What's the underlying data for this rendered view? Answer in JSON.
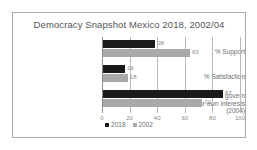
{
  "chart_data": {
    "type": "bar",
    "orientation": "horizontal",
    "title": "Democracy Snapshot Mexico 2018, 2002/04",
    "xlabel": "",
    "ylabel": "",
    "xlim": [
      0,
      100
    ],
    "xticks": [
      "0",
      "20",
      "40",
      "60",
      "80",
      "100"
    ],
    "grid": true,
    "legend_position": "bottom",
    "categories": [
      "% Support",
      "% Satisfaction",
      "% Powerful govern for own interests (2004)"
    ],
    "category_lines": [
      [
        "% Support"
      ],
      [
        "% Satisfaction"
      ],
      [
        "% Powerful govern",
        "for own interests",
        "(2004)"
      ]
    ],
    "series": [
      {
        "name": "2018",
        "color": "#1a1a1a",
        "values": [
          38,
          16,
          87
        ]
      },
      {
        "name": "2002",
        "color": "#a9a9a9",
        "values": [
          63,
          18,
          72
        ]
      }
    ]
  },
  "legend": {
    "items": [
      {
        "label": "2018",
        "color": "#1a1a1a"
      },
      {
        "label": "2002",
        "color": "#a9a9a9"
      }
    ]
  },
  "colors": {
    "series_2018": "#1a1a1a",
    "series_2002": "#a9a9a9",
    "gridline": "#b9b9b9",
    "frame": "#aaaaaa",
    "text": "#6f6f6f"
  }
}
